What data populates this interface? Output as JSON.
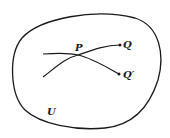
{
  "diagram": {
    "region_label": "U",
    "point_labels": {
      "intersection": "P",
      "endpoint_1": "Q",
      "endpoint_2": "Q′"
    },
    "colors": {
      "stroke": "#1a1a1a",
      "background": "#ffffff"
    }
  }
}
